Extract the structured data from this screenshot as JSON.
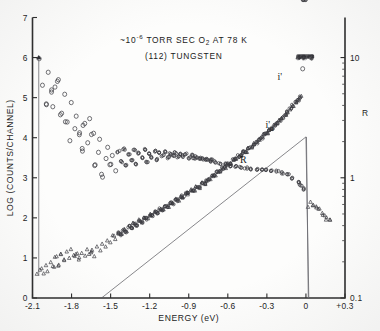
{
  "figure": {
    "name": "electron-energy-distribution-plot",
    "title_line_1_prefix": "~10",
    "title_line_1_exponent": "-6",
    "title_line_1_mid": " TORR SEC O",
    "title_line_1_sub": "2",
    "title_line_1_suffix": " AT 78 K",
    "title_line_2": "(112) TUNGSTEN"
  },
  "chart_data": {
    "type": "scatter",
    "xlabel": "ENERGY (eV)",
    "ylabel": "LOG (COUNTS/CHANNEL)",
    "y2label": "R",
    "xlim": [
      -2.1,
      0.3
    ],
    "ylim": [
      0,
      7
    ],
    "y2lim": [
      0.1,
      10
    ],
    "y2_scale": "log",
    "grid": false,
    "legend": "inline-annotations",
    "xticks": [
      "-2.1",
      "-1.8",
      "-1.5",
      "-1.2",
      "-0.9",
      "-0.6",
      "-0.3",
      "0",
      "+0.3"
    ],
    "xtick_values": [
      -2.1,
      -1.8,
      -1.5,
      -1.2,
      -0.9,
      -0.6,
      -0.3,
      0,
      0.3
    ],
    "yticks": [
      "0",
      "1",
      "2",
      "3",
      "4",
      "5",
      "6",
      "7"
    ],
    "ytick_values": [
      0,
      1,
      2,
      3,
      4,
      5,
      6,
      7
    ],
    "y2ticks": [
      "10",
      "1",
      "0.1"
    ],
    "y2tick_values": [
      6,
      3,
      0
    ],
    "annotations": [
      {
        "text": "i'",
        "x": -0.2,
        "y": 5.45,
        "name": "curve-label-i-prime"
      },
      {
        "text": "i'",
        "sub": "0",
        "x": -0.28,
        "y": 4.25,
        "name": "curve-label-i-prime-zero"
      },
      {
        "text": "R",
        "x": -0.48,
        "y": 3.38,
        "name": "curve-label-r"
      }
    ],
    "series": [
      {
        "name": "i' (measured energy distribution)",
        "marker": "triangle",
        "points_x": [
          -2.06,
          -2.04,
          -2.02,
          -2.0,
          -1.98,
          -1.96,
          -1.94,
          -1.92,
          -1.9,
          -1.88,
          -1.86,
          -1.84,
          -1.82,
          -1.8,
          -1.78,
          -1.76,
          -1.74,
          -1.72,
          -1.7,
          -1.68,
          -1.66,
          -1.64,
          -1.62,
          -1.6,
          -1.58,
          -1.56,
          -1.54,
          -1.52,
          -1.5,
          -1.48,
          -1.46,
          -1.44,
          -1.42,
          -1.4,
          -1.38,
          -1.36,
          -1.34,
          -1.32,
          -1.3,
          -1.28,
          -1.26,
          -1.24,
          -1.22,
          -1.2,
          -1.18,
          -1.16,
          -1.14,
          -1.12,
          -1.1,
          -1.08,
          -1.06,
          -1.04,
          -1.02,
          -1.0,
          -0.98,
          -0.96,
          -0.94,
          -0.92,
          -0.9,
          -0.88,
          -0.86,
          -0.84,
          -0.82,
          -0.8,
          -0.78,
          -0.76,
          -0.74,
          -0.72,
          -0.7,
          -0.68,
          -0.66,
          -0.64,
          -0.62,
          -0.6,
          -0.58,
          -0.56,
          -0.54,
          -0.52,
          -0.5,
          -0.48,
          -0.46,
          -0.44,
          -0.42,
          -0.4,
          -0.38,
          -0.36,
          -0.34,
          -0.32,
          -0.3,
          -0.28,
          -0.26,
          -0.24,
          -0.22,
          -0.2,
          -0.18,
          -0.16,
          -0.14,
          -0.12,
          -0.1,
          -0.08,
          -0.06,
          -0.04,
          -0.02,
          0.0
        ],
        "points_y": [
          0.62,
          0.72,
          0.58,
          0.8,
          0.68,
          0.9,
          0.78,
          1.02,
          0.84,
          1.1,
          0.95,
          1.16,
          1.0,
          1.2,
          1.06,
          1.12,
          0.98,
          1.15,
          1.08,
          1.22,
          1.1,
          1.18,
          1.05,
          1.28,
          1.2,
          1.35,
          1.3,
          1.45,
          1.4,
          1.55,
          1.5,
          1.62,
          1.58,
          1.7,
          1.66,
          1.78,
          1.74,
          1.86,
          1.82,
          1.94,
          1.9,
          2.0,
          1.98,
          2.08,
          2.06,
          2.15,
          2.12,
          2.22,
          2.2,
          2.3,
          2.28,
          2.38,
          2.36,
          2.46,
          2.44,
          2.54,
          2.52,
          2.62,
          2.6,
          2.7,
          2.68,
          2.78,
          2.76,
          2.86,
          2.84,
          2.94,
          2.96,
          3.04,
          3.06,
          3.14,
          3.16,
          3.24,
          3.26,
          3.34,
          3.36,
          3.44,
          3.46,
          3.54,
          3.56,
          3.64,
          3.66,
          3.74,
          3.76,
          3.85,
          3.88,
          3.96,
          4.0,
          4.08,
          4.12,
          4.2,
          4.24,
          4.32,
          4.36,
          4.44,
          4.5,
          4.58,
          4.64,
          4.72,
          4.8,
          4.88,
          4.95,
          5.02
        ]
      },
      {
        "name": "R (ratio curve)",
        "marker": "circle",
        "points_x": [
          -2.05,
          -2.02,
          -2.0,
          -1.98,
          -1.96,
          -1.94,
          -1.92,
          -1.9,
          -1.88,
          -1.86,
          -1.84,
          -1.82,
          -1.8,
          -1.78,
          -1.76,
          -1.74,
          -1.72,
          -1.7,
          -1.68,
          -1.66,
          -1.64,
          -1.62,
          -1.6,
          -1.58,
          -1.56,
          -1.54,
          -1.52,
          -1.5,
          -1.48,
          -1.46,
          -1.44,
          -1.42,
          -1.4,
          -1.38,
          -1.36,
          -1.34,
          -1.32,
          -1.3,
          -1.28,
          -1.26,
          -1.24,
          -1.22,
          -1.2,
          -1.18,
          -1.16,
          -1.14,
          -1.12,
          -1.1,
          -1.08,
          -1.06,
          -1.04,
          -1.02,
          -1.0,
          -0.98,
          -0.96,
          -0.94,
          -0.92,
          -0.9,
          -0.88,
          -0.86,
          -0.84,
          -0.82,
          -0.8,
          -0.78,
          -0.76,
          -0.74,
          -0.72,
          -0.7,
          -0.66,
          -0.62,
          -0.58,
          -0.54,
          -0.5,
          -0.46,
          -0.42,
          -0.38,
          -0.34,
          -0.3,
          -0.26,
          -0.22,
          -0.18,
          -0.14,
          -0.1,
          -0.06,
          -0.04,
          -0.02
        ],
        "points_y": [
          6.0,
          5.3,
          4.85,
          5.65,
          5.15,
          4.75,
          5.25,
          5.45,
          4.6,
          5.05,
          4.4,
          3.95,
          4.85,
          4.2,
          4.55,
          4.1,
          3.7,
          4.35,
          3.85,
          4.45,
          4.05,
          3.3,
          3.6,
          3.95,
          3.05,
          3.45,
          3.75,
          3.35,
          3.55,
          3.2,
          3.65,
          3.4,
          3.72,
          3.3,
          3.58,
          3.45,
          3.68,
          3.35,
          3.62,
          3.5,
          3.7,
          3.4,
          3.6,
          3.52,
          3.66,
          3.46,
          3.62,
          3.55,
          3.64,
          3.5,
          3.6,
          3.56,
          3.62,
          3.52,
          3.58,
          3.54,
          3.6,
          3.5,
          3.56,
          3.48,
          3.52,
          3.46,
          3.5,
          3.44,
          3.46,
          3.42,
          3.44,
          3.4,
          3.36,
          3.34,
          3.3,
          3.28,
          3.26,
          3.24,
          3.22,
          3.22,
          3.2,
          3.2,
          3.18,
          3.16,
          3.12,
          3.08,
          3.0,
          2.9,
          2.82,
          2.72
        ]
      },
      {
        "name": "i'0 (theoretical / reference line)",
        "marker": "line",
        "points_x": [
          -1.57,
          0.0
        ],
        "points_y": [
          0.0,
          4.02
        ]
      },
      {
        "name": "high-energy tail",
        "marker": "triangle",
        "points_x": [
          0.02,
          0.04,
          0.06,
          0.08,
          0.1,
          0.12,
          0.14,
          0.16,
          0.18
        ],
        "points_y": [
          2.3,
          2.42,
          2.35,
          2.28,
          2.2,
          2.12,
          2.05,
          1.98,
          1.92
        ]
      },
      {
        "name": "saturated cluster near zero",
        "marker": "dense-blob",
        "points_x": [
          -0.04,
          0.0
        ],
        "points_y": [
          6.0,
          5.72
        ]
      }
    ]
  }
}
